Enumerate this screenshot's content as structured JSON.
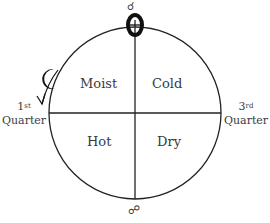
{
  "diagram": {
    "quadrants": {
      "top_left": "Moist",
      "top_right": "Cold",
      "bottom_left": "Hot",
      "bottom_right": "Dry"
    },
    "left_label": {
      "number": "1",
      "suffix": "st",
      "word": "Quarter"
    },
    "right_label": {
      "number": "3",
      "suffix": "rd",
      "word": "Quarter"
    },
    "symbols": {
      "top": "sun-conjunction-symbol",
      "top_small": "conjunction-glyph",
      "bottom": "opposition-glyph",
      "moon": "crescent-moon-icon"
    },
    "glyphs": {
      "conjunction": "☌",
      "opposition": "☍"
    }
  }
}
